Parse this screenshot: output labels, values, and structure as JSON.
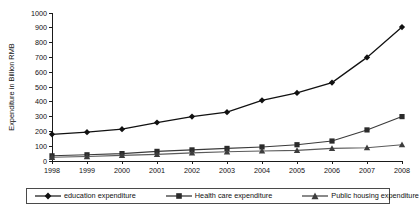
{
  "chart_data": {
    "type": "line",
    "title": "",
    "xlabel": "",
    "ylabel": "Expenditure in Billion RMB",
    "categories": [
      "1998",
      "1999",
      "2000",
      "2001",
      "2002",
      "2003",
      "2004",
      "2005",
      "2006",
      "2007",
      "2008"
    ],
    "x": [
      1998,
      1999,
      2000,
      2001,
      2002,
      2003,
      2004,
      2005,
      2006,
      2007,
      2008
    ],
    "ylim": [
      0,
      1000
    ],
    "yticks": [
      0,
      100,
      200,
      300,
      400,
      500,
      600,
      700,
      800,
      900,
      1000
    ],
    "ytick_labels": [
      "0",
      "100",
      "200",
      "300",
      "400",
      "500",
      "600",
      "700",
      "800",
      "900",
      "1000"
    ],
    "grid": false,
    "legend_position": "bottom",
    "series": [
      {
        "name": "education expenditure",
        "marker": "diamond",
        "color": "#111111",
        "values": [
          180,
          195,
          215,
          260,
          300,
          330,
          410,
          460,
          530,
          700,
          905
        ]
      },
      {
        "name": "Health care expenditure",
        "marker": "square",
        "color": "#2b2b2b",
        "values": [
          35,
          42,
          50,
          65,
          75,
          85,
          95,
          110,
          135,
          210,
          300
        ]
      },
      {
        "name": "Public housing expenditure",
        "marker": "triangle",
        "color": "#3d3d3d",
        "values": [
          25,
          30,
          38,
          45,
          55,
          62,
          68,
          72,
          85,
          90,
          110
        ]
      }
    ]
  },
  "legend": {
    "entries": [
      {
        "label": "education expenditure"
      },
      {
        "label": "Health care expenditure"
      },
      {
        "label": "Public housing expenditure"
      }
    ]
  }
}
